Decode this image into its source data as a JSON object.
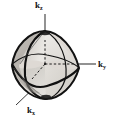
{
  "figure": {
    "title": "",
    "background_color": "#ffffff",
    "line_color": "#111111",
    "shade_light": "#e6e4e0",
    "shade_mid": "#d2cfca",
    "shade_dark": "#b9b5af",
    "axes": [
      {
        "name": "k-z-axis",
        "label_base": "k",
        "label_sub": "z",
        "label_full": "kz",
        "direction": "up",
        "line_from": [
          45,
          64
        ],
        "line_to": [
          45,
          15
        ]
      },
      {
        "name": "k-y-axis",
        "label_base": "k",
        "label_sub": "y",
        "label_full": "ky",
        "direction": "right",
        "line_from": [
          45,
          64
        ],
        "line_to": [
          96,
          64
        ]
      },
      {
        "name": "k-x-axis",
        "label_base": "k",
        "label_sub": "x",
        "label_full": "kx",
        "direction": "lower-left",
        "line_from": [
          45,
          64
        ],
        "line_to": [
          16,
          104
        ]
      }
    ],
    "body": {
      "name": "octahedron-solid",
      "vertex_top": [
        45,
        31
      ],
      "vertex_bottom": [
        47,
        99
      ],
      "vertex_right": [
        79,
        70
      ],
      "vertex_left": [
        12,
        63
      ],
      "meridian_curve": "vertical ellipse through top and bottom vertices",
      "equator_curve": "horizontal ellipse through left and right vertices"
    }
  }
}
